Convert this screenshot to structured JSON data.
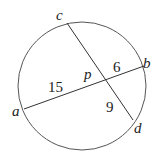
{
  "diagram": {
    "type": "intersecting-chords",
    "circle": {
      "stroke": "#555555"
    },
    "chords": [
      {
        "from": "a",
        "to": "b"
      },
      {
        "from": "c",
        "to": "d"
      }
    ],
    "points": {
      "a": "a",
      "b": "b",
      "c": "c",
      "d": "d",
      "p": "p"
    },
    "segments": {
      "ap": "15",
      "pb": "6",
      "pd": "9"
    }
  }
}
